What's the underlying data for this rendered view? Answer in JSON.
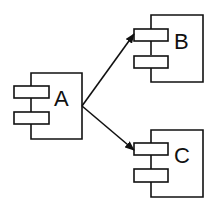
{
  "diagram": {
    "type": "component-diagram",
    "components": [
      {
        "id": "A",
        "label": "A"
      },
      {
        "id": "B",
        "label": "B"
      },
      {
        "id": "C",
        "label": "C"
      }
    ],
    "edges": [
      {
        "from": "A",
        "to": "B",
        "arrow": "filled"
      },
      {
        "from": "A",
        "to": "C",
        "arrow": "filled"
      }
    ],
    "colors": {
      "stroke": "#111111",
      "background": "#ffffff"
    }
  }
}
